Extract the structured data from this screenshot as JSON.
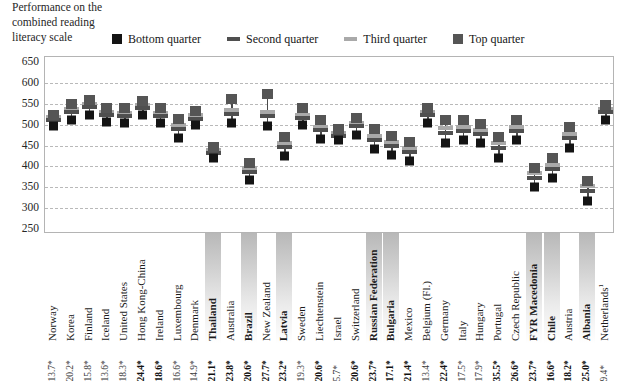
{
  "axis_title": "Performance on the combined reading literacy scale",
  "legend": {
    "items": [
      {
        "label": "Bottom quarter",
        "marker": "square",
        "color": "#141414"
      },
      {
        "label": "Second quarter",
        "marker": "dash",
        "color": "#4f4f4f"
      },
      {
        "label": "Third quarter",
        "marker": "dash",
        "color": "#a9a9a9"
      },
      {
        "label": "Top quarter",
        "marker": "square",
        "color": "#555555"
      }
    ]
  },
  "chart_data": {
    "type": "scatter",
    "title": "Performance on the combined reading literacy scale",
    "xlabel": "",
    "ylabel": "Performance on the combined reading literacy scale",
    "ylim": [
      250,
      650
    ],
    "yticks": [
      650,
      600,
      550,
      500,
      450,
      400,
      350,
      300,
      250
    ],
    "grid": true,
    "legend_position": "top",
    "categories": [
      "Norway",
      "Korea",
      "Finland",
      "Iceland",
      "United States",
      "Hong Kong-China",
      "Ireland",
      "Luxembourg",
      "Denmark",
      "Thailand",
      "Australia",
      "Brazil",
      "New Zealand",
      "Latvia",
      "Sweden",
      "Liechtenstein",
      "Israel",
      "Switzerland",
      "Russian Federation",
      "Bulgaria",
      "Mexico",
      "Belgium (Fl.)",
      "Germany",
      "Italy",
      "Hungary",
      "Portugal",
      "Czech Republic",
      "FYR Macedonia",
      "Chile",
      "Austria",
      "Albania",
      "Netherlands"
    ],
    "highlighted": [
      "Thailand",
      "Brazil",
      "Latvia",
      "Russian Federation",
      "Bulgaria",
      "FYR Macedonia",
      "Chile",
      "Albania"
    ],
    "superscripts": {
      "Netherlands": "1"
    },
    "percentages": [
      "13.7*",
      "20.2*",
      "15.8*",
      "13.6*",
      "18.3*",
      "24.4*",
      "18.6*",
      "16.6*",
      "14.9*",
      "21.1*",
      "23.8*",
      "20.6*",
      "27.7*",
      "23.2*",
      "19.3*",
      "20.6*",
      "5.7*",
      "20.6*",
      "23.7*",
      "17.1*",
      "21.4*",
      "13.4*",
      "22.4*",
      "17.5*",
      "17.9*",
      "35.5*",
      "26.6*",
      "23.7*",
      "16.6*",
      "18.2*",
      "25.0*",
      "9.4*"
    ],
    "percentages_bold": [
      false,
      false,
      false,
      false,
      false,
      true,
      true,
      false,
      false,
      true,
      true,
      true,
      true,
      true,
      false,
      true,
      false,
      true,
      true,
      true,
      true,
      false,
      true,
      false,
      false,
      true,
      true,
      true,
      true,
      true,
      true,
      false
    ],
    "series": [
      {
        "name": "Bottom quarter",
        "values": [
          497,
          512,
          524,
          506,
          505,
          524,
          503,
          468,
          498,
          420,
          504,
          368,
          496,
          426,
          498,
          465,
          462,
          476,
          441,
          427,
          413,
          504,
          456,
          462,
          455,
          421,
          463,
          350,
          373,
          445,
          318,
          512
        ]
      },
      {
        "name": "Second quarter",
        "values": [
          510,
          530,
          542,
          523,
          521,
          540,
          521,
          489,
          514,
          431,
          525,
          387,
          521,
          447,
          516,
          486,
          473,
          496,
          462,
          448,
          434,
          522,
          481,
          484,
          477,
          445,
          484,
          373,
          393,
          468,
          340,
          530
        ]
      },
      {
        "name": "Third quarter",
        "values": [
          518,
          538,
          549,
          531,
          529,
          547,
          529,
          499,
          522,
          439,
          535,
          396,
          531,
          457,
          524,
          494,
          480,
          504,
          472,
          458,
          444,
          530,
          492,
          494,
          487,
          455,
          494,
          384,
          404,
          478,
          352,
          538
        ]
      },
      {
        "name": "Top quarter",
        "values": [
          524,
          549,
          559,
          541,
          540,
          557,
          540,
          513,
          533,
          447,
          562,
          409,
          573,
          470,
          539,
          510,
          489,
          517,
          489,
          472,
          459,
          541,
          512,
          512,
          502,
          471,
          511,
          397,
          419,
          494,
          364,
          548
        ]
      }
    ]
  }
}
